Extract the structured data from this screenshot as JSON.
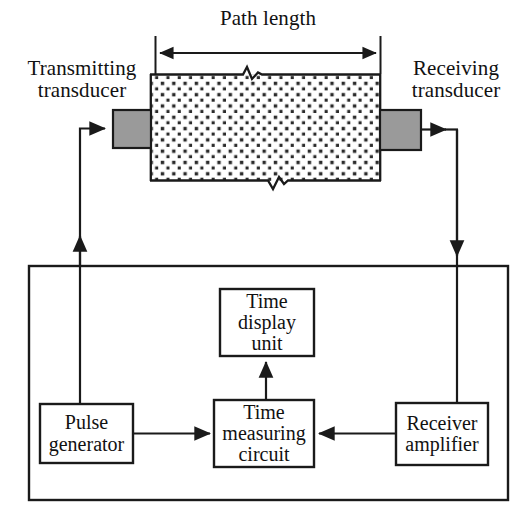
{
  "diagram": {
    "dimension_label": "Path length",
    "labels": {
      "transmitting_transducer_line1": "Transmitting",
      "transmitting_transducer_line2": "transducer",
      "receiving_transducer_line1": "Receiving",
      "receiving_transducer_line2": "transducer"
    },
    "blocks": [
      {
        "id": "pulse-generator",
        "line1": "Pulse",
        "line2": "generator",
        "line3": ""
      },
      {
        "id": "time-measuring-circuit",
        "line1": "Time",
        "line2": "measuring",
        "line3": "circuit"
      },
      {
        "id": "time-display-unit",
        "line1": "Time",
        "line2": "display",
        "line3": "unit"
      },
      {
        "id": "receiver-amplifier",
        "line1": "Receiver",
        "line2": "amplifier",
        "line3": ""
      }
    ],
    "colors": {
      "line": "#1a1a1a",
      "transducer_fill": "#9a9a9a",
      "specimen_fill": "#ffffff",
      "specimen_dots": "#2b2b2b",
      "background": "#ffffff"
    }
  }
}
